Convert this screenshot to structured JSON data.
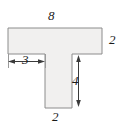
{
  "figure": {
    "kind": "t-shaped-polygon-with-dimensions",
    "shape_fill": "#f1f0ef",
    "shape_stroke": "#8c8c8c",
    "dimension_stroke": "#3a3a3a",
    "background": "#ffffff",
    "labels": {
      "top_width": "8",
      "right_height": "2",
      "left_flange_width": "3",
      "stem_height": "4",
      "bottom_width": "2"
    },
    "geometry": {
      "top_rect": {
        "x": 8,
        "y": 28,
        "width": 94,
        "height": 26
      },
      "stem_rect": {
        "x": 45,
        "y": 54,
        "width": 27,
        "height": 54
      }
    },
    "dimension_lines": {
      "left_flange": {
        "y": 61,
        "x1": 8,
        "x2": 45
      },
      "stem": {
        "x": 78,
        "y1": 55,
        "y2": 107
      }
    }
  }
}
